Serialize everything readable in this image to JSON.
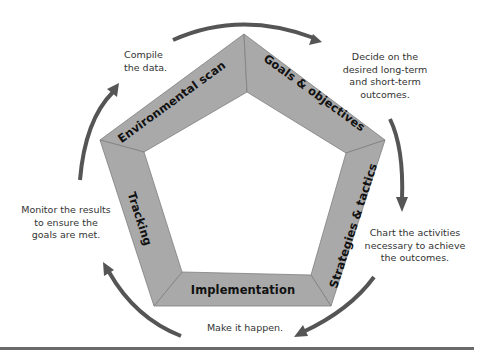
{
  "diagram": {
    "type": "cycle",
    "colors": {
      "segment_fill": "#a9a9a9",
      "segment_stroke": "#7f7f7f",
      "arrow": "#555555",
      "label_text": "#111111",
      "note_text": "#333333"
    },
    "stages": [
      {
        "label": "Environmental scan",
        "note": [
          "Compile",
          "the data."
        ]
      },
      {
        "label": "Goals & objectives",
        "note": [
          "Decide on the",
          "desired long-term",
          "and short-term",
          "outcomes."
        ]
      },
      {
        "label": "Strategies & tactics",
        "note": [
          "Chart the activities",
          "necessary to achieve",
          "the outcomes."
        ]
      },
      {
        "label": "Implementation",
        "note": [
          "Make it happen."
        ]
      },
      {
        "label": "Tracking",
        "note": [
          "Monitor the results",
          "to ensure the",
          "goals are met."
        ]
      }
    ],
    "flow_direction": "clockwise"
  }
}
